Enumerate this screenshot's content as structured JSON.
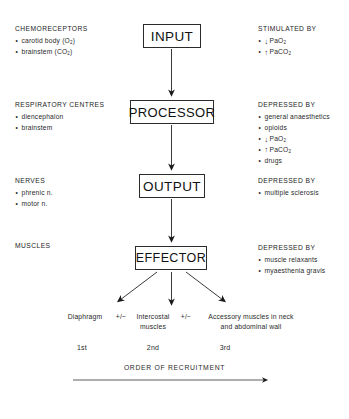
{
  "diagram": {
    "nodes": [
      {
        "id": "input",
        "label": "INPUT"
      },
      {
        "id": "processor",
        "label": "PROCESSOR"
      },
      {
        "id": "output",
        "label": "OUTPUT"
      },
      {
        "id": "effector",
        "label": "EFFECTOR"
      }
    ],
    "left_annotations": [
      {
        "id": "chemoreceptors",
        "heading": "CHEMORECEPTORS",
        "items": [
          "carotid body (O₂)",
          "brainstem (CO₂)"
        ]
      },
      {
        "id": "respiratory-centres",
        "heading": "RESPIRATORY CENTRES",
        "items": [
          "diencephalon",
          "brainstem"
        ]
      },
      {
        "id": "nerves",
        "heading": "NERVES",
        "items": [
          "phrenic n.",
          "motor n."
        ]
      },
      {
        "id": "muscles",
        "heading": "MUSCLES",
        "items": []
      }
    ],
    "right_annotations": [
      {
        "id": "stimulated-by-input",
        "heading": "STIMULATED BY",
        "items": [
          {
            "arrow": "down",
            "text": "PaO₂"
          },
          {
            "arrow": "up",
            "text": "PaCO₂"
          }
        ]
      },
      {
        "id": "depressed-by-processor",
        "heading": "DEPRESSED BY",
        "items": [
          {
            "arrow": "",
            "text": "general anaesthetics"
          },
          {
            "arrow": "",
            "text": "opioids"
          },
          {
            "arrow": "down",
            "text": "PaO₂"
          },
          {
            "arrow": "up",
            "text": "PaCO₂"
          },
          {
            "arrow": "",
            "text": "drugs"
          }
        ]
      },
      {
        "id": "depressed-by-output",
        "heading": "DEPRESSED BY",
        "items": [
          {
            "arrow": "",
            "text": "multiple sclerosis"
          }
        ]
      },
      {
        "id": "depressed-by-effector",
        "heading": "DEPRESSED BY",
        "items": [
          {
            "arrow": "",
            "text": "muscle relaxants"
          },
          {
            "arrow": "",
            "text": "myaesthenia gravis"
          }
        ]
      }
    ],
    "branches": {
      "first": "Diaphragm",
      "plus_minus_1": "+/−",
      "second_line1": "Intercostal",
      "second_line2": "muscles",
      "plus_minus_2": "+/−",
      "third_line1": "Accessory muscles in neck",
      "third_line2": "and abdominal wall"
    },
    "ordinals": [
      "1st",
      "2nd",
      "3rd"
    ],
    "recruitment_caption": "ORDER OF RECRUITMENT",
    "colors": {
      "ink": "#1a1a1a",
      "line": "#2b2b2b",
      "background": "#ffffff"
    }
  }
}
